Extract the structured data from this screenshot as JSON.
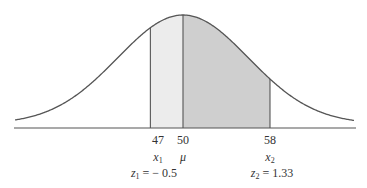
{
  "diagram": {
    "type": "normal-distribution",
    "mean": 50,
    "x1": 47,
    "x2": 58,
    "z1": -0.5,
    "z2": 1.33,
    "colors": {
      "curve": "#555555",
      "axis": "#555555",
      "shade_light": "#ececec",
      "shade_dark": "#cfcfcf"
    }
  },
  "labels": {
    "tick_x1": "47",
    "tick_mean": "50",
    "tick_x2": "58",
    "var_x1": "x",
    "var_x1_sub": "1",
    "var_mean": "μ",
    "var_x2": "x",
    "var_x2_sub": "2",
    "z1_var": "z",
    "z1_sub": "1",
    "z1_value": " = − 0.5",
    "z2_var": "z",
    "z2_sub": "2",
    "z2_value": " = 1.33"
  }
}
